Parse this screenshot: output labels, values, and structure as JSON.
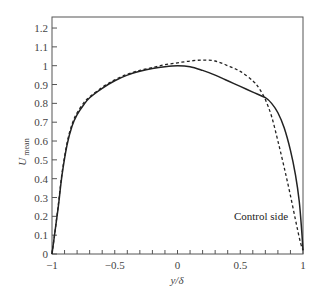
{
  "chart_data": {
    "type": "line",
    "title": "",
    "xlabel": "y/δ",
    "ylabel": "U",
    "ylabel_subscript": "mean",
    "xlim": [
      -1,
      1
    ],
    "ylim": [
      0,
      1.25
    ],
    "x_ticks": [
      -1,
      -0.5,
      0,
      0.5,
      1
    ],
    "x_tick_labels": [
      "−1",
      "−0.5",
      "0",
      "0.5",
      "1"
    ],
    "x_minor_step": 0.1,
    "y_ticks": [
      0,
      0.1,
      0.2,
      0.3,
      0.4,
      0.5,
      0.6,
      0.7,
      0.8,
      0.9,
      1,
      1.1,
      1.2
    ],
    "y_tick_labels": [
      "0",
      "0.1",
      "0.2",
      "0.3",
      "0.4",
      "0.5",
      "0.6",
      "0.7",
      "0.8",
      "0.9",
      "1",
      "1.1",
      "1.2"
    ],
    "grid": false,
    "legend": null,
    "annotations": [
      {
        "text": "Control side",
        "x": 0.45,
        "y": 0.18
      }
    ],
    "series": [
      {
        "name": "solid",
        "style": "solid",
        "color": "#222222",
        "x": [
          -1.0,
          -0.98,
          -0.95,
          -0.92,
          -0.88,
          -0.84,
          -0.8,
          -0.75,
          -0.7,
          -0.6,
          -0.5,
          -0.4,
          -0.3,
          -0.2,
          -0.1,
          0.0,
          0.1,
          0.2,
          0.3,
          0.4,
          0.5,
          0.6,
          0.7,
          0.75,
          0.8,
          0.85,
          0.9,
          0.94,
          0.97,
          0.99,
          1.0
        ],
        "y": [
          0.0,
          0.1,
          0.25,
          0.42,
          0.58,
          0.68,
          0.74,
          0.79,
          0.83,
          0.88,
          0.92,
          0.95,
          0.97,
          0.985,
          0.995,
          1.0,
          0.995,
          0.975,
          0.95,
          0.92,
          0.89,
          0.86,
          0.83,
          0.8,
          0.75,
          0.67,
          0.55,
          0.42,
          0.28,
          0.12,
          0.02
        ]
      },
      {
        "name": "dashed",
        "style": "dashed",
        "color": "#222222",
        "x": [
          -1.0,
          -0.98,
          -0.95,
          -0.92,
          -0.88,
          -0.84,
          -0.8,
          -0.75,
          -0.7,
          -0.6,
          -0.5,
          -0.4,
          -0.3,
          -0.2,
          -0.1,
          0.0,
          0.1,
          0.2,
          0.3,
          0.4,
          0.5,
          0.6,
          0.65,
          0.7,
          0.75,
          0.8,
          0.85,
          0.9,
          0.95,
          0.98,
          1.0
        ],
        "y": [
          0.0,
          0.1,
          0.26,
          0.43,
          0.59,
          0.69,
          0.75,
          0.8,
          0.835,
          0.885,
          0.925,
          0.955,
          0.975,
          0.99,
          1.005,
          1.015,
          1.025,
          1.03,
          1.025,
          1.0,
          0.97,
          0.92,
          0.88,
          0.82,
          0.73,
          0.6,
          0.46,
          0.31,
          0.15,
          0.06,
          0.02
        ]
      }
    ]
  }
}
